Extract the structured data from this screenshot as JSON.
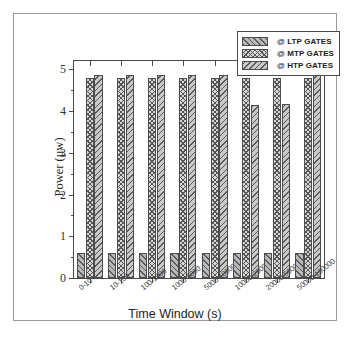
{
  "chart_data": {
    "type": "bar",
    "title": "",
    "xlabel": "Time Window (s)",
    "ylabel": "Power (μw)",
    "categories": [
      "0-10",
      "10-100",
      "100-1000",
      "1000-5000",
      "5000-10000",
      "10000-20000",
      "20000-50000",
      "50000-100000"
    ],
    "series": [
      {
        "name": "@ LTP GATES",
        "pattern": "diagonal-hatch-right",
        "values": [
          0.6,
          0.6,
          0.6,
          0.6,
          0.6,
          0.6,
          0.6,
          0.6
        ]
      },
      {
        "name": "@ MTP GATES",
        "pattern": "cross-hatch",
        "values": [
          4.79,
          4.79,
          4.79,
          4.79,
          4.79,
          4.79,
          4.8,
          4.8
        ]
      },
      {
        "name": "@ HTP GATES",
        "pattern": "diagonal-hatch-left",
        "values": [
          4.87,
          4.87,
          4.87,
          4.87,
          4.87,
          4.15,
          4.16,
          4.9
        ]
      }
    ],
    "ylim": [
      0,
      5.2
    ],
    "yticks": [
      0,
      1,
      2,
      3,
      4,
      5
    ],
    "ytick_labels": [
      "0",
      "1",
      "2",
      "3",
      "4",
      "5"
    ],
    "grid": false,
    "legend_position": "top-right",
    "colors": {
      "axis": "#4a4a4a",
      "bar_edge": "#4d4d4d",
      "frame": "#9a9a9a",
      "text": "#222222"
    }
  },
  "legend": {
    "items": [
      {
        "label": "@ LTP GATES"
      },
      {
        "label": "@ MTP GATES"
      },
      {
        "label": "@ HTP GATES"
      }
    ]
  }
}
